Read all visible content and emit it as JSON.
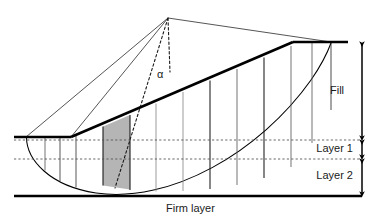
{
  "figure": {
    "type": "slope-stability-slice-diagram",
    "background_color": "#ffffff",
    "line_color": "#000000",
    "thin_line_color": "#444444",
    "dashed_line_color": "#666666",
    "shaded_slice_fill": "#b0b0b0"
  },
  "labels": {
    "fill": "Fill",
    "layer1": "Layer 1",
    "layer2": "Layer 2",
    "firm_layer": "Firm layer",
    "alpha": "α"
  },
  "geometry": {
    "center_of_circle": {
      "x": 168,
      "y": 18
    },
    "crest": {
      "x": 293,
      "y": 42
    },
    "crest_right_end": {
      "x": 348,
      "y": 42
    },
    "toe": {
      "x": 71,
      "y": 137
    },
    "ground_left_end": {
      "x": 14,
      "y": 137
    },
    "firm_layer_y": 196,
    "fill_base_y": 140,
    "layer1_bottom_y": 159,
    "dimension_line_x": 362,
    "slope_top": {
      "x": 293,
      "y": 42
    },
    "slope_bottom": {
      "x": 71,
      "y": 137
    },
    "slice_boundaries_x": [
      60,
      76,
      103,
      130,
      156,
      183,
      210,
      237,
      264,
      291
    ],
    "shaded_slice": {
      "x_left": 103,
      "x_right": 130
    }
  },
  "dimensions": [
    {
      "name": "Fill",
      "top_y": 42,
      "bottom_y": 140,
      "label": "Fill"
    },
    {
      "name": "Layer 1",
      "top_y": 140,
      "bottom_y": 159,
      "label": "Layer 1"
    },
    {
      "name": "Layer 2",
      "top_y": 159,
      "bottom_y": 196,
      "label": "Layer 2"
    }
  ]
}
